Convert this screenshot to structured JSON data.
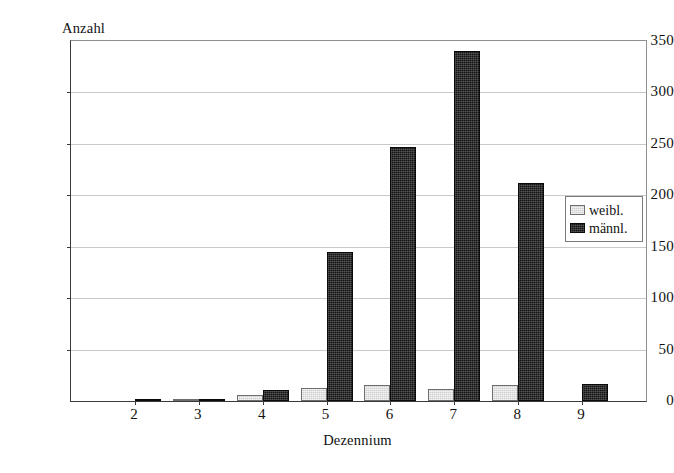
{
  "chart_data": {
    "type": "bar",
    "title": "",
    "subtitle": "",
    "xlabel": "Dezennium",
    "ylabel": "Anzahl",
    "categories": [
      "2",
      "3",
      "4",
      "5",
      "6",
      "7",
      "8",
      "9"
    ],
    "series": [
      {
        "name": "weibl.",
        "color": "#cfcfcf",
        "values": [
          0,
          2,
          6,
          13,
          16,
          12,
          16,
          0
        ]
      },
      {
        "name": "männl.",
        "color": "#141414",
        "values": [
          1,
          2,
          11,
          145,
          247,
          340,
          212,
          17
        ]
      }
    ],
    "ylim": [
      0,
      350
    ],
    "ytick_step": 50,
    "yticks": [
      0,
      50,
      100,
      150,
      200,
      250,
      300,
      350
    ],
    "ytick_labels": [
      "0",
      "50",
      "100",
      "150",
      "200",
      "250",
      "300",
      "350"
    ],
    "grid": true,
    "grid_axis": "y",
    "legend_position": "inside-right",
    "annotations": []
  },
  "legend": {
    "entries": [
      {
        "label": "weibl.",
        "swatch": "light-gray-hatch-swatch"
      },
      {
        "label": "männl.",
        "swatch": "dark-hatch-swatch"
      }
    ]
  },
  "axes": {
    "y_title": "Anzahl",
    "x_title": "Dezennium"
  }
}
